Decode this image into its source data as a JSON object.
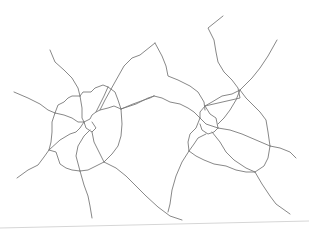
{
  "figure": {
    "width": 309,
    "height": 232,
    "background": "#ffffff",
    "stroke_color": "#7a7a7a",
    "page_edge_color": "#d6d6d6",
    "page_edge": [
      [
        0,
        228
      ],
      [
        309,
        221
      ]
    ],
    "clusters": [
      {
        "name": "left-city",
        "center": [
          85,
          125
        ],
        "paths": [
          [
            [
              50,
              50
            ],
            [
              55,
              62
            ],
            [
              64,
              70
            ],
            [
              72,
              78
            ],
            [
              78,
              88
            ],
            [
              80,
              96
            ]
          ],
          [
            [
              14,
              92
            ],
            [
              28,
              98
            ],
            [
              40,
              104
            ],
            [
              48,
              110
            ],
            [
              55,
              113
            ]
          ],
          [
            [
              17,
              178
            ],
            [
              28,
              170
            ],
            [
              38,
              165
            ],
            [
              44,
              157
            ],
            [
              49,
              150
            ]
          ],
          [
            [
              80,
              171
            ],
            [
              84,
              185
            ],
            [
              88,
              196
            ],
            [
              90,
              206
            ],
            [
              92,
              218
            ]
          ],
          [
            [
              104,
              162
            ],
            [
              116,
              168
            ],
            [
              126,
              176
            ],
            [
              136,
              186
            ],
            [
              146,
              196
            ],
            [
              158,
              207
            ],
            [
              170,
              216
            ],
            [
              182,
              220
            ]
          ],
          [
            [
              121,
              109
            ],
            [
              133,
              104
            ],
            [
              144,
              100
            ],
            [
              150,
              98
            ],
            [
              154,
              96
            ]
          ],
          [
            [
              155,
              43
            ],
            [
              140,
              55
            ],
            [
              132,
              58
            ],
            [
              124,
              66
            ],
            [
              115,
              82
            ],
            [
              105,
              100
            ],
            [
              100,
              110
            ]
          ],
          [
            [
              80,
              96
            ],
            [
              83,
              92
            ],
            [
              91,
              92
            ],
            [
              95,
              88
            ],
            [
              103,
              85
            ],
            [
              108,
              87
            ]
          ],
          [
            [
              55,
              113
            ],
            [
              58,
              105
            ],
            [
              64,
              102
            ],
            [
              68,
              98
            ],
            [
              72,
              96
            ],
            [
              80,
              96
            ]
          ],
          [
            [
              55,
              113
            ],
            [
              52,
              122
            ],
            [
              52,
              132
            ],
            [
              51,
              142
            ],
            [
              49,
              150
            ]
          ],
          [
            [
              49,
              150
            ],
            [
              56,
              152
            ],
            [
              58,
              158
            ],
            [
              60,
              164
            ],
            [
              66,
              168
            ],
            [
              72,
              170
            ],
            [
              80,
              171
            ]
          ],
          [
            [
              80,
              171
            ],
            [
              88,
              170
            ],
            [
              96,
              166
            ],
            [
              104,
              162
            ]
          ],
          [
            [
              104,
              162
            ],
            [
              112,
              154
            ],
            [
              118,
              146
            ],
            [
              121,
              136
            ],
            [
              122,
              124
            ],
            [
              121,
              109
            ]
          ],
          [
            [
              121,
              109
            ],
            [
              118,
              100
            ],
            [
              115,
              92
            ],
            [
              108,
              87
            ]
          ],
          [
            [
              80,
              96
            ],
            [
              82,
              108
            ],
            [
              82,
              118
            ],
            [
              84,
              122
            ]
          ],
          [
            [
              55,
              113
            ],
            [
              64,
              115
            ],
            [
              72,
              118
            ],
            [
              78,
              122
            ],
            [
              84,
              122
            ]
          ],
          [
            [
              84,
              122
            ],
            [
              90,
              119
            ],
            [
              92,
              115
            ],
            [
              96,
              112
            ],
            [
              100,
              110
            ],
            [
              108,
              108
            ],
            [
              114,
              106
            ],
            [
              121,
              109
            ]
          ],
          [
            [
              108,
              87
            ],
            [
              104,
              96
            ],
            [
              100,
              104
            ],
            [
              96,
              112
            ]
          ],
          [
            [
              84,
              122
            ],
            [
              80,
              128
            ],
            [
              76,
              132
            ],
            [
              70,
              134
            ],
            [
              60,
              140
            ],
            [
              49,
              150
            ]
          ],
          [
            [
              84,
              122
            ],
            [
              86,
              128
            ],
            [
              92,
              132
            ],
            [
              96,
              128
            ],
            [
              92,
              122
            ]
          ],
          [
            [
              92,
              132
            ],
            [
              94,
              142
            ],
            [
              98,
              150
            ],
            [
              102,
              158
            ],
            [
              104,
              162
            ]
          ],
          [
            [
              90,
              130
            ],
            [
              84,
              136
            ],
            [
              78,
              146
            ],
            [
              76,
              156
            ],
            [
              80,
              171
            ]
          ]
        ]
      },
      {
        "name": "right-city",
        "center": [
          210,
          125
        ],
        "paths": [
          [
            [
              223,
              16
            ],
            [
              208,
              28
            ],
            [
              214,
              40
            ],
            [
              216,
              52
            ],
            [
              218,
              62
            ],
            [
              224,
              72
            ],
            [
              232,
              80
            ],
            [
              238,
              88
            ],
            [
              240,
              98
            ],
            [
              205,
              106
            ]
          ],
          [
            [
              277,
              40
            ],
            [
              268,
              56
            ],
            [
              260,
              68
            ],
            [
              252,
              78
            ],
            [
              246,
              84
            ],
            [
              240,
              90
            ]
          ],
          [
            [
              155,
              43
            ],
            [
              162,
              56
            ],
            [
              166,
              66
            ],
            [
              168,
              76
            ],
            [
              178,
              80
            ],
            [
              190,
              86
            ],
            [
              198,
              92
            ],
            [
              204,
              102
            ],
            [
              205,
              110
            ]
          ],
          [
            [
              154,
              96
            ],
            [
              162,
              98
            ],
            [
              170,
              102
            ],
            [
              180,
              104
            ],
            [
              188,
              108
            ],
            [
              194,
              112
            ],
            [
              200,
              118
            ]
          ],
          [
            [
              189,
              151
            ],
            [
              182,
              162
            ],
            [
              176,
              176
            ],
            [
              172,
              190
            ],
            [
              170,
              204
            ],
            [
              168,
              212
            ]
          ],
          [
            [
              255,
              172
            ],
            [
              262,
              184
            ],
            [
              270,
              196
            ],
            [
              276,
              204
            ],
            [
              290,
              214
            ]
          ],
          [
            [
              270,
              146
            ],
            [
              280,
              148
            ],
            [
              290,
              152
            ],
            [
              296,
              158
            ]
          ],
          [
            [
              205,
              106
            ],
            [
              212,
              102
            ],
            [
              222,
              96
            ],
            [
              232,
              94
            ],
            [
              240,
              90
            ]
          ],
          [
            [
              240,
              90
            ],
            [
              246,
              98
            ],
            [
              252,
              104
            ],
            [
              260,
              112
            ],
            [
              266,
              120
            ],
            [
              268,
              132
            ],
            [
              270,
              146
            ]
          ],
          [
            [
              270,
              146
            ],
            [
              268,
              158
            ],
            [
              264,
              166
            ],
            [
              255,
              172
            ]
          ],
          [
            [
              255,
              172
            ],
            [
              246,
              172
            ],
            [
              236,
              170
            ],
            [
              226,
              166
            ],
            [
              214,
              164
            ],
            [
              204,
              160
            ],
            [
              196,
              156
            ],
            [
              189,
              151
            ]
          ],
          [
            [
              189,
              151
            ],
            [
              188,
              142
            ],
            [
              190,
              134
            ],
            [
              196,
              128
            ],
            [
              200,
              118
            ]
          ],
          [
            [
              205,
              106
            ],
            [
              200,
              112
            ],
            [
              200,
              118
            ]
          ],
          [
            [
              200,
              118
            ],
            [
              206,
              124
            ],
            [
              212,
              126
            ],
            [
              218,
              128
            ]
          ],
          [
            [
              205,
              106
            ],
            [
              210,
              114
            ],
            [
              216,
              118
            ],
            [
              218,
              128
            ]
          ],
          [
            [
              218,
              128
            ],
            [
              214,
              132
            ],
            [
              208,
              134
            ],
            [
              202,
              130
            ],
            [
              200,
              124
            ]
          ],
          [
            [
              240,
              90
            ],
            [
              236,
              100
            ],
            [
              230,
              110
            ],
            [
              224,
              118
            ],
            [
              218,
              124
            ]
          ],
          [
            [
              218,
              128
            ],
            [
              230,
              130
            ],
            [
              242,
              134
            ],
            [
              256,
              140
            ],
            [
              270,
              146
            ]
          ],
          [
            [
              212,
              132
            ],
            [
              220,
              142
            ],
            [
              226,
              152
            ],
            [
              234,
              160
            ],
            [
              246,
              168
            ],
            [
              255,
              172
            ]
          ],
          [
            [
              206,
              134
            ],
            [
              198,
              138
            ],
            [
              194,
              144
            ],
            [
              189,
              151
            ]
          ]
        ]
      }
    ],
    "connectors": [
      [
        [
          121,
          109
        ],
        [
          136,
          104
        ],
        [
          148,
          98
        ],
        [
          154,
          96
        ]
      ]
    ]
  }
}
